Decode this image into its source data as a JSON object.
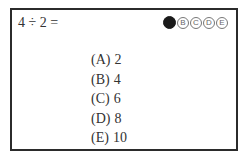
{
  "question": {
    "text": "4 ÷ 2 ="
  },
  "answer_bubbles": [
    {
      "letter": "A",
      "filled": true
    },
    {
      "letter": "B",
      "filled": false
    },
    {
      "letter": "C",
      "filled": false
    },
    {
      "letter": "D",
      "filled": false
    },
    {
      "letter": "E",
      "filled": false
    }
  ],
  "choices": [
    {
      "label": "(A)",
      "value": "2"
    },
    {
      "label": "(B)",
      "value": "4"
    },
    {
      "label": "(C)",
      "value": "6"
    },
    {
      "label": "(D)",
      "value": "8"
    },
    {
      "label": "(E)",
      "value": "10"
    }
  ],
  "colors": {
    "border": "#2b2b2b",
    "text": "#333333",
    "filled_bubble": "#1a1a1a"
  }
}
